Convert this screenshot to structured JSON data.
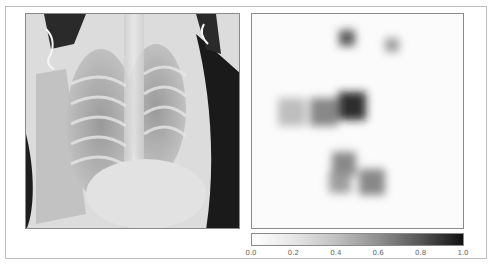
{
  "figure": {
    "left_panel": {
      "name": "chest-xray-image",
      "description": "Grayscale frontal chest X-ray"
    },
    "right_panel": {
      "name": "attention-heatmap",
      "description": "Grayscale saliency heatmap (dark = high activation)"
    }
  },
  "colorbar": {
    "min": 0.0,
    "max": 1.0,
    "ticks": [
      "0.0",
      "0.2",
      "0.4",
      "0.6",
      "0.8",
      "1.0"
    ],
    "colors": {
      "low": "#ffffff",
      "high": "#101010"
    }
  },
  "heatmap_blobs": [
    {
      "cx": 95,
      "cy": 24,
      "r": 8,
      "v": 0.75
    },
    {
      "cx": 140,
      "cy": 31,
      "r": 7,
      "v": 0.45
    },
    {
      "cx": 100,
      "cy": 92,
      "r": 14,
      "v": 0.95
    },
    {
      "cx": 72,
      "cy": 98,
      "r": 14,
      "v": 0.55
    },
    {
      "cx": 40,
      "cy": 98,
      "r": 14,
      "v": 0.3
    },
    {
      "cx": 92,
      "cy": 150,
      "r": 12,
      "v": 0.55
    },
    {
      "cx": 120,
      "cy": 168,
      "r": 13,
      "v": 0.55
    },
    {
      "cx": 88,
      "cy": 168,
      "r": 11,
      "v": 0.45
    }
  ]
}
